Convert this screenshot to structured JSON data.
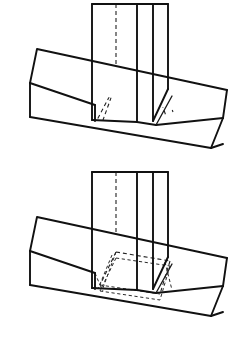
{
  "document": {
    "title": "Isometric Joint Detail Drawing",
    "caption": "",
    "background_color": "#ffffff",
    "line_color": "#111111",
    "hidden_line_color": "#222222",
    "canvas": {
      "width": 233,
      "height": 349
    }
  },
  "figures": [
    {
      "id": "figure-top",
      "label": "Through mortise and tenon joint — assembled view",
      "rail_label": "Horizontal rail",
      "post_label": "Vertical post",
      "hidden_lines_visible": true,
      "notes": "Vertical post seated into horizontal rail; hidden edges of the tenon shown dashed."
    },
    {
      "id": "figure-bottom",
      "label": "Through mortise and tenon joint — hidden mortise view",
      "rail_label": "Horizontal rail",
      "post_label": "Vertical post",
      "hidden_lines_visible": true,
      "notes": "Same joint with the full mortise cavity outlined in dashed hidden lines."
    }
  ],
  "geometry": {
    "top_figure": {
      "post_outline": "M 92,4 L 153,4 L 153,120 L 92,120 Z",
      "post_front_left_x": 92,
      "post_front_right_x": 153,
      "post_top_y": 4,
      "rail_top_left": "30,83",
      "rail_top_back_left": "37,49",
      "rail_far_right": "223,118",
      "rail_bottom_y": 148
    },
    "bottom_figure": {
      "post_outline": "M 92,172 L 153,172 L 153,288 L 92,288 Z",
      "post_front_left_x": 92,
      "post_front_right_x": 153,
      "post_top_y": 172,
      "rail_top_left": "30,251",
      "rail_top_back_left": "37,217",
      "rail_far_right": "223,286",
      "rail_bottom_y": 316
    }
  }
}
